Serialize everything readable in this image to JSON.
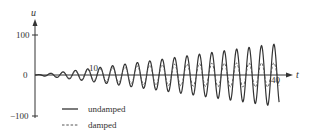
{
  "chart_data": {
    "type": "line",
    "title": "",
    "xlabel": "t",
    "ylabel": "u",
    "xlim": [
      0,
      40
    ],
    "ylim": [
      -100,
      100
    ],
    "x_ticks": [
      10,
      40
    ],
    "x_tick_labels": [
      "10",
      "40"
    ],
    "y_ticks": [
      100,
      0,
      -100
    ],
    "y_tick_labels": [
      "100",
      "0",
      "−100"
    ],
    "grid": false,
    "legend_position": "lower-left",
    "series": [
      {
        "name": "undamped",
        "style": "solid",
        "description": "oscillation with frequency ~3 rad/unit whose amplitude grows roughly linearly with t (resonance)",
        "amplitude_samples": {
          "t": [
            0,
            5,
            10,
            20,
            30,
            40
          ],
          "amplitude": [
            0,
            8,
            17,
            36,
            56,
            76
          ]
        }
      },
      {
        "name": "damped",
        "style": "dashed",
        "description": "oscillation with same frequency; amplitude follows undamped early then saturates near ~30",
        "amplitude_samples": {
          "t": [
            0,
            5,
            10,
            20,
            30,
            40
          ],
          "amplitude": [
            0,
            7,
            14,
            25,
            29,
            30
          ]
        }
      }
    ],
    "omega": 3
  },
  "legend": {
    "items": [
      {
        "label": "undamped",
        "style": "solid"
      },
      {
        "label": "damped",
        "style": "dashed"
      }
    ]
  },
  "axes": {
    "x_label": "t",
    "y_label": "u",
    "tick_10": "10",
    "tick_40": "40",
    "tick_100": "100",
    "tick_0": "0",
    "tick_neg100": "−100"
  }
}
